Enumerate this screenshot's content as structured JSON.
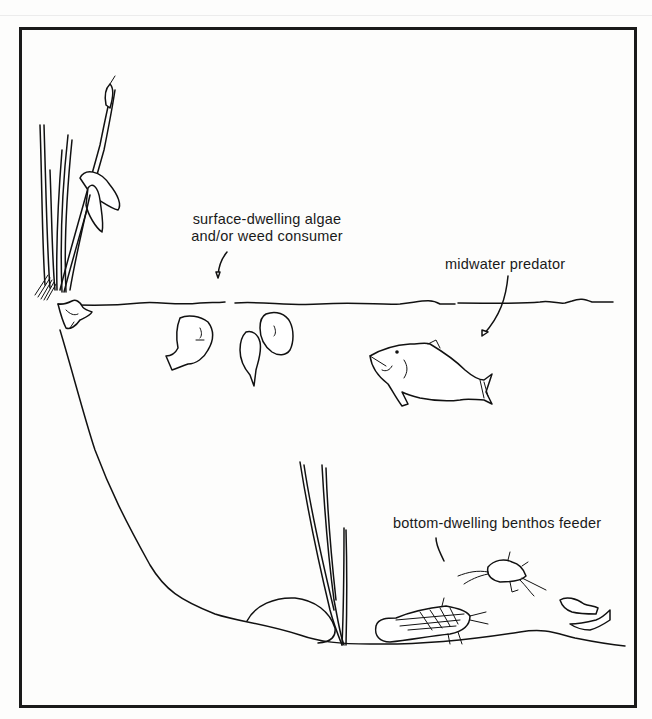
{
  "figure": {
    "type": "pond cross-section illustration",
    "border_color": "#1a1a1a",
    "background_color": "#fdfdfc",
    "ink_color": "#111111"
  },
  "labels": {
    "surface": {
      "line1": "surface-dwelling algae",
      "line2": "and/or weed consumer"
    },
    "midwater": "midwater predator",
    "bottom": "bottom-dwelling benthos feeder"
  },
  "elements": [
    {
      "name": "cattail-plant",
      "zone": "shore"
    },
    {
      "name": "frog",
      "zone": "water surface"
    },
    {
      "name": "water-surface-line",
      "zone": "surface"
    },
    {
      "name": "surface-fish-group",
      "count": 3,
      "zone": "surface"
    },
    {
      "name": "midwater-predator-fish",
      "count": 1,
      "zone": "midwater"
    },
    {
      "name": "submerged-plant",
      "zone": "bottom"
    },
    {
      "name": "rock",
      "zone": "bottom"
    },
    {
      "name": "catfish-group",
      "count": 2,
      "zone": "bottom"
    },
    {
      "name": "small-bottom-fish",
      "count": 2,
      "zone": "bottom"
    }
  ]
}
